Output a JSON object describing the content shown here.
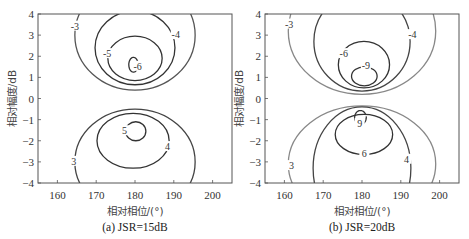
{
  "chart_data": [
    {
      "type": "contour",
      "caption": "(a) JSR=15dB",
      "xlabel": "相对相位/(°)",
      "ylabel": "相对幅度/dB",
      "xlim": [
        155,
        205
      ],
      "ylim": [
        -4,
        4
      ],
      "xticks": [
        160,
        170,
        180,
        190,
        200
      ],
      "yticks": [
        4,
        3,
        2,
        1,
        0,
        -1,
        -2,
        -3,
        -4
      ],
      "contours": [
        {
          "level": "-3",
          "cx": 180,
          "cy": 3.0,
          "rx": 15.5,
          "ry": 2.6,
          "color": "#555555",
          "label_at": [
            164.5,
            3.4
          ]
        },
        {
          "level": "-4",
          "cx": 180,
          "cy": 2.4,
          "rx": 10.3,
          "ry": 1.75,
          "color": "#333333",
          "label_at": [
            190.5,
            3.0
          ]
        },
        {
          "level": "-5",
          "cx": 180,
          "cy": 1.9,
          "rx": 7.0,
          "ry": 1.05,
          "color": "#333333",
          "label_at": [
            172.8,
            2.1
          ]
        },
        {
          "level": "-6",
          "cx": 179.6,
          "cy": 1.6,
          "rx": 1.2,
          "ry": 0.35,
          "color": "#333333",
          "label_at": [
            180.7,
            1.5
          ],
          "arc": true
        },
        {
          "level": "3",
          "cx": 180,
          "cy": -3.0,
          "rx": 15.5,
          "ry": 2.5,
          "color": "#444444",
          "label_at": [
            164.2,
            -3.0
          ]
        },
        {
          "level": "4",
          "cx": 179.5,
          "cy": -2.0,
          "rx": 9.3,
          "ry": 1.3,
          "color": "#333333",
          "label_at": [
            188.4,
            -2.3
          ]
        },
        {
          "level": "5",
          "cx": 180.2,
          "cy": -1.55,
          "rx": 2.6,
          "ry": 0.45,
          "color": "#333333",
          "label_at": [
            177.3,
            -1.55
          ]
        }
      ]
    },
    {
      "type": "contour",
      "caption": "(b) JSR=20dB",
      "xlabel": "相对相位/(°)",
      "ylabel": "相对幅度/dB",
      "xlim": [
        155,
        205
      ],
      "ylim": [
        -4,
        4
      ],
      "xticks": [
        160,
        170,
        180,
        190,
        200
      ],
      "yticks": [
        4,
        3,
        2,
        1,
        0,
        -1,
        -2,
        -3,
        -4
      ],
      "contours": [
        {
          "level": "-3",
          "cx": 180,
          "cy": 3.2,
          "rx": 19.0,
          "ry": 3.0,
          "color": "#888888",
          "label_at": [
            161.2,
            3.5
          ]
        },
        {
          "level": "-4",
          "cx": 180,
          "cy": 2.7,
          "rx": 12.4,
          "ry": 2.35,
          "color": "#444444",
          "label_at": [
            193.0,
            3.0
          ]
        },
        {
          "level": "-6",
          "cx": 180.5,
          "cy": 1.6,
          "rx": 6.6,
          "ry": 1.1,
          "color": "#333333",
          "label_at": [
            175.3,
            2.1
          ]
        },
        {
          "level": "-9",
          "cx": 180.6,
          "cy": 1.05,
          "rx": 3.3,
          "ry": 0.45,
          "color": "#333333",
          "label_at": [
            181.0,
            1.55
          ]
        },
        {
          "level": "3",
          "cx": 180,
          "cy": -3.1,
          "rx": 19.0,
          "ry": 2.75,
          "color": "#888888",
          "label_at": [
            161.8,
            -3.2
          ]
        },
        {
          "level": "4",
          "cx": 180,
          "cy": -3.3,
          "rx": 12.6,
          "ry": 2.9,
          "color": "#444444",
          "label_at": [
            191.5,
            -2.9
          ]
        },
        {
          "level": "6",
          "cx": 180.5,
          "cy": -1.7,
          "rx": 7.4,
          "ry": 0.95,
          "color": "#333333",
          "label_at": [
            180.6,
            -2.65
          ]
        },
        {
          "level": "9",
          "cx": 179.6,
          "cy": -0.9,
          "rx": 1.5,
          "ry": 0.33,
          "color": "#333333",
          "label_at": [
            179.4,
            -1.2
          ],
          "arc": true
        }
      ]
    }
  ]
}
